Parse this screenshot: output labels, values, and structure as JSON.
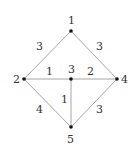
{
  "graph": {
    "nodes": [
      {
        "id": "1",
        "label": "1",
        "x": 71,
        "y": 31,
        "label_x": 68,
        "label_y": 24
      },
      {
        "id": "2",
        "label": "2",
        "x": 24,
        "y": 79,
        "label_x": 13,
        "label_y": 83
      },
      {
        "id": "3",
        "label": "3",
        "x": 71,
        "y": 79,
        "label_x": 68,
        "label_y": 73
      },
      {
        "id": "4",
        "label": "4",
        "x": 117,
        "y": 79,
        "label_x": 121,
        "label_y": 83
      },
      {
        "id": "5",
        "label": "5",
        "x": 71,
        "y": 127,
        "label_x": 67,
        "label_y": 143
      }
    ],
    "edges": [
      {
        "from": "1",
        "to": "2",
        "weight": "3",
        "label_x": 36,
        "label_y": 50
      },
      {
        "from": "1",
        "to": "4",
        "weight": "3",
        "label_x": 96,
        "label_y": 50
      },
      {
        "from": "2",
        "to": "3",
        "weight": "1",
        "label_x": 46,
        "label_y": 75
      },
      {
        "from": "3",
        "to": "4",
        "weight": "2",
        "label_x": 87,
        "label_y": 75
      },
      {
        "from": "3",
        "to": "5",
        "weight": "1",
        "label_x": 61,
        "label_y": 103
      },
      {
        "from": "2",
        "to": "5",
        "weight": "4",
        "label_x": 36,
        "label_y": 113
      },
      {
        "from": "4",
        "to": "5",
        "weight": "3",
        "label_x": 96,
        "label_y": 113
      }
    ]
  }
}
